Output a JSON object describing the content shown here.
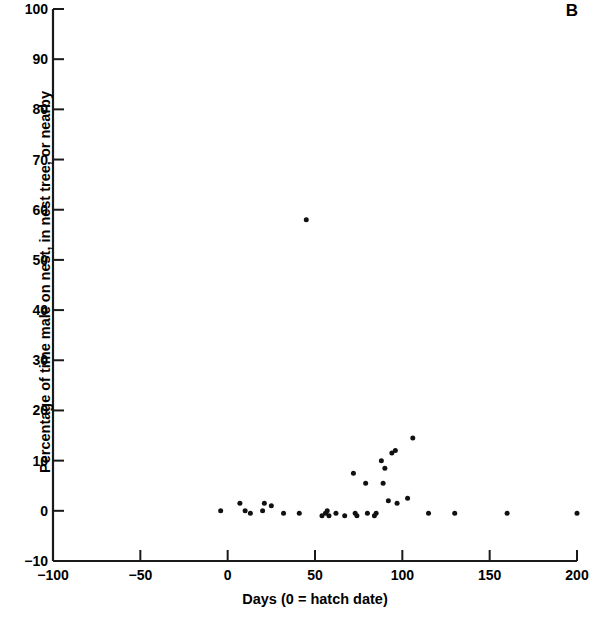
{
  "panel": {
    "label": "B"
  },
  "chart_data": {
    "type": "scatter",
    "title": "",
    "subtitle": "",
    "xlabel": "Days (0 = hatch date)",
    "ylabel": "Percentage of time male on nest, in nest tree, or nearby",
    "xlim": [
      -100,
      200
    ],
    "ylim": [
      -10,
      100
    ],
    "xticks": [
      -100,
      -50,
      0,
      50,
      100,
      150,
      200
    ],
    "xtick_labels": [
      "−100",
      "−50",
      "0",
      "50",
      "100",
      "150",
      "200"
    ],
    "yticks": [
      -10,
      0,
      10,
      20,
      30,
      40,
      50,
      60,
      70,
      80,
      90,
      100
    ],
    "ytick_labels": [
      "−10",
      "0",
      "10",
      "20",
      "30",
      "40",
      "50",
      "60",
      "70",
      "80",
      "90",
      "100"
    ],
    "grid": false,
    "legend": null,
    "marker": {
      "shape": "circle",
      "color": "#111111",
      "size_px": 5
    },
    "series": [
      {
        "name": "male nest attendance",
        "points": [
          [
            -4,
            0
          ],
          [
            7,
            1.5
          ],
          [
            10,
            0
          ],
          [
            13,
            -0.5
          ],
          [
            20,
            0
          ],
          [
            21,
            1.5
          ],
          [
            25,
            1
          ],
          [
            32,
            -0.5
          ],
          [
            41,
            -0.5
          ],
          [
            45,
            58
          ],
          [
            54,
            -1
          ],
          [
            56,
            -0.5
          ],
          [
            57,
            0
          ],
          [
            58,
            -1
          ],
          [
            62,
            -0.5
          ],
          [
            67,
            -1
          ],
          [
            72,
            7.5
          ],
          [
            73,
            -0.5
          ],
          [
            74,
            -1
          ],
          [
            79,
            5.5
          ],
          [
            80,
            -0.5
          ],
          [
            84,
            -1
          ],
          [
            85,
            -0.5
          ],
          [
            88,
            10
          ],
          [
            89,
            5.5
          ],
          [
            90,
            8.5
          ],
          [
            92,
            2
          ],
          [
            94,
            11.5
          ],
          [
            96,
            12
          ],
          [
            97,
            1.5
          ],
          [
            103,
            2.5
          ],
          [
            106,
            14.5
          ],
          [
            115,
            -0.5
          ],
          [
            130,
            -0.5
          ],
          [
            160,
            -0.5
          ],
          [
            200,
            -0.5
          ]
        ]
      }
    ]
  }
}
